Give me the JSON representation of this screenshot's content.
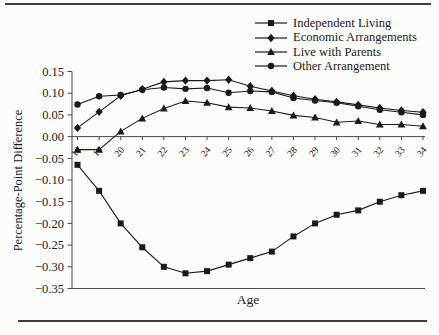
{
  "chart_data": {
    "type": "line",
    "title": "",
    "xlabel": "Age",
    "ylabel": "Percentage-Point Difference",
    "x": [
      18,
      19,
      20,
      21,
      22,
      23,
      24,
      25,
      26,
      27,
      28,
      29,
      30,
      31,
      32,
      33,
      34
    ],
    "ylim": [
      -0.35,
      0.15
    ],
    "ytick_values": [
      0.15,
      0.1,
      0.05,
      0.0,
      -0.05,
      -0.1,
      -0.15,
      -0.2,
      -0.25,
      -0.3,
      -0.35
    ],
    "ytick_labels": [
      "0.15",
      "0.10",
      "0.05",
      "0.00",
      "−0.05",
      "−0.10",
      "−0.15",
      "−0.20",
      "−0.25",
      "−0.30",
      "−0.35"
    ],
    "grid": false,
    "legend_position": "top-right",
    "line_color": "#1a1a1a",
    "axis_color": "#4a4a4a",
    "series": [
      {
        "name": "Independent Living",
        "marker": "square",
        "values": [
          -0.065,
          -0.125,
          -0.2,
          -0.255,
          -0.3,
          -0.315,
          -0.31,
          -0.295,
          -0.28,
          -0.265,
          -0.23,
          -0.2,
          -0.18,
          -0.17,
          -0.15,
          -0.135,
          -0.125
        ]
      },
      {
        "name": "Economic Arrangements",
        "marker": "diamond",
        "values": [
          0.02,
          0.057,
          0.094,
          0.109,
          0.126,
          0.129,
          0.129,
          0.131,
          0.116,
          0.105,
          0.094,
          0.086,
          0.08,
          0.073,
          0.066,
          0.06,
          0.056
        ]
      },
      {
        "name": "Live with Parents",
        "marker": "triangle",
        "values": [
          -0.03,
          -0.03,
          0.012,
          0.042,
          0.065,
          0.082,
          0.078,
          0.068,
          0.066,
          0.059,
          0.049,
          0.044,
          0.033,
          0.036,
          0.028,
          0.028,
          0.024
        ]
      },
      {
        "name": "Other Arrangement",
        "marker": "circle",
        "values": [
          0.074,
          0.093,
          0.096,
          0.108,
          0.113,
          0.11,
          0.112,
          0.101,
          0.105,
          0.103,
          0.089,
          0.083,
          0.078,
          0.07,
          0.062,
          0.056,
          0.05
        ]
      }
    ]
  }
}
